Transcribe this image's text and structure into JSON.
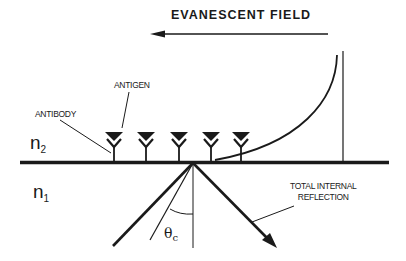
{
  "diagram": {
    "title": "EVANESCENT FIELD",
    "labels": {
      "antigen": "ANTIGEN",
      "antibody": "ANTIBODY",
      "tir_line1": "TOTAL INTERNAL",
      "tir_line2": "REFLECTION",
      "medium_upper": "n",
      "medium_upper_sub": "2",
      "medium_lower": "n",
      "medium_lower_sub": "1",
      "angle": "θ",
      "angle_sub": "c"
    },
    "antibody_count": 5,
    "colors": {
      "ink": "#1a1a1a",
      "background": "#ffffff"
    }
  }
}
